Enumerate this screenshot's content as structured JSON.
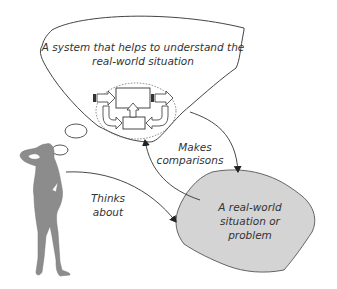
{
  "diagram": {
    "thought_cloud": {
      "text_line1": "A system that helps to understand the",
      "text_line2": "real-world situation"
    },
    "situation_blob": {
      "text_line1": "A real-world",
      "text_line2": "situation or",
      "text_line3": "problem"
    },
    "arrow_labels": {
      "makes_line1": "Makes",
      "makes_line2": "comparisons",
      "thinks_line1": "Thinks",
      "thinks_line2": "about"
    },
    "colors": {
      "figure_fill": "#8c8c8c",
      "blob_fill": "#d4d4d4",
      "stroke": "#333333"
    }
  }
}
